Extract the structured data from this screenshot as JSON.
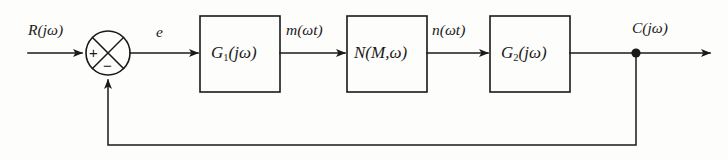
{
  "diagram": {
    "type": "control-system-block-diagram",
    "background_color": "#fdfdfb",
    "line_color": "#1a1a1a",
    "signals": {
      "input": "R(jω)",
      "error": "e",
      "after_g1": "m(ωt)",
      "after_n": "n(ωt)",
      "output": "C(jω)"
    },
    "summing_junction": {
      "name": "summing-junction",
      "shape": "circle-with-cross",
      "plus_sign": "+",
      "minus_sign": "−",
      "plus_port": "left",
      "minus_port": "bottom"
    },
    "blocks": [
      {
        "id": "g1",
        "label_main": "G",
        "label_sub": "1",
        "label_arg": "(jω)"
      },
      {
        "id": "n",
        "label_main": "N",
        "label_sub": "",
        "label_arg": "(M,ω)"
      },
      {
        "id": "g2",
        "label_main": "G",
        "label_sub": "2",
        "label_arg": "(jω)"
      }
    ],
    "feedback": {
      "name": "unity-feedback-path",
      "has_block": false,
      "takeoff_node": "filled-dot"
    }
  }
}
